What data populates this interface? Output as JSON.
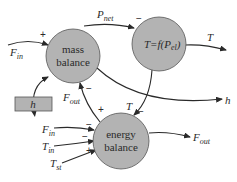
{
  "diagram": {
    "type": "causal-loop",
    "colors": {
      "node_fill": "#b3b3b3",
      "node_stroke": "#555555",
      "edge": "#2a2a2a",
      "box_fill": "#b3b3b3"
    },
    "nodes": {
      "mass_balance": {
        "line1": "mass",
        "line2": "balance"
      },
      "temperature": {
        "label_main": "T=f(P",
        "label_sub": "el",
        "label_end": ")"
      },
      "energy_balance": {
        "line1": "energy",
        "line2": "balance"
      },
      "level_box": {
        "label": "h"
      }
    },
    "variables": {
      "F_in_top": {
        "main": "F",
        "sub": "in"
      },
      "P_net": {
        "main": "P",
        "sub": "net"
      },
      "T_out": {
        "main": "T"
      },
      "h_out": {
        "main": "h"
      },
      "F_out_mid": {
        "main": "F",
        "sub": "out"
      },
      "T_mid": {
        "main": "T"
      },
      "F_in_bottom": {
        "main": "F",
        "sub": "in"
      },
      "T_in": {
        "main": "T",
        "sub": "in"
      },
      "T_st": {
        "main": "T",
        "sub": "st"
      },
      "F_out_bottom": {
        "main": "F",
        "sub": "out"
      }
    },
    "signs": {
      "F_in_to_mass": "+",
      "P_net_to_T": "−",
      "F_out_to_mass": "−",
      "mass_to_energy": "+",
      "T_to_energy": "−",
      "F_in_to_energy": "−",
      "T_in_to_energy": "−",
      "T_st_to_energy": "+"
    }
  }
}
